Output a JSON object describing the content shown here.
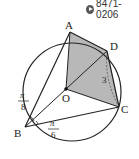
{
  "code_badge": {
    "icon": "play-circle-icon",
    "text": "8471-0206"
  },
  "diagram": {
    "type": "inscribed quadrilateral in circle",
    "circle": {
      "cx": 72,
      "cy": 92,
      "r": 49
    },
    "points": {
      "A": {
        "label": "A",
        "x": 70,
        "y": 32
      },
      "D": {
        "label": "D",
        "x": 107,
        "y": 51
      },
      "C": {
        "label": "C",
        "x": 119,
        "y": 107
      },
      "B": {
        "label": "B",
        "x": 25,
        "y": 127
      },
      "O": {
        "label": "O",
        "x": 66,
        "y": 89
      }
    },
    "segment_label_DC": "3",
    "angle_ABO": {
      "numerator": "π",
      "denominator": "8"
    },
    "angle_OBC": {
      "numerator": "π",
      "denominator": "6"
    },
    "colors": {
      "shaded_fill": "#b8b8b8",
      "line": "#222222",
      "dashed": "#555555"
    }
  }
}
